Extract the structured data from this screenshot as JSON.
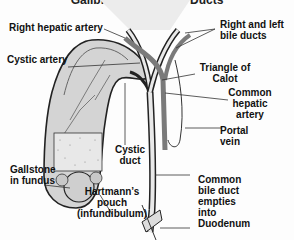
{
  "title": "Gallbladder and Bile Ducts",
  "labels": {
    "right_hepatic_artery": "Right hepatic artery",
    "right_left_bile_ducts_1": "Right and left",
    "right_left_bile_ducts_2": "bile ducts",
    "cystic_artery": "Cystic artery",
    "triangle_of_calot_1": "Triangle of",
    "triangle_of_calot_2": "Calot",
    "common_hepatic_artery_1": "Common",
    "common_hepatic_artery_2": "hepatic",
    "common_hepatic_artery_3": "artery",
    "portal_vein_1": "Portal",
    "portal_vein_2": "vein",
    "cystic_duct_1": "Cystic",
    "cystic_duct_2": "duct",
    "gallstone_1": "Gallstone",
    "gallstone_2": "in fundus",
    "hartmann_1": "Hartmann’s",
    "hartmann_2": "pouch",
    "hartmann_3": "(infundibulum)",
    "cbd_1": "Common",
    "cbd_2": "bile duct",
    "cbd_3": "empties",
    "cbd_4": "into",
    "cbd_5": "Duodenum"
  },
  "colors": {
    "organ_fill": "#d4d4d4",
    "artery": "#7a7a7a",
    "outline": "#222222"
  }
}
